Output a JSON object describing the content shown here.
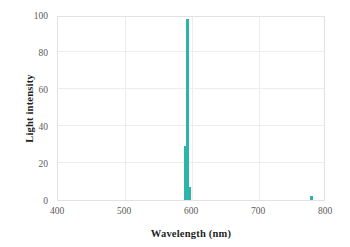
{
  "chart_data": {
    "type": "bar",
    "title": "",
    "subtitle": "",
    "xlabel": "Wavelength (nm)",
    "ylabel": "Light intensity",
    "xlim": [
      400,
      800
    ],
    "ylim": [
      0,
      100
    ],
    "xticks": [
      400,
      500,
      600,
      700,
      800
    ],
    "yticks": [
      0,
      20,
      40,
      60,
      80,
      100
    ],
    "xtick_labels": [
      "400",
      "500",
      "600",
      "700",
      "800"
    ],
    "ytick_labels": [
      "0",
      "20",
      "40",
      "60",
      "80",
      "100"
    ],
    "grid": true,
    "legend": false,
    "legend_position": "none",
    "bar_color": "#2eb5ab",
    "bar_width_nm": 3,
    "series": [
      {
        "name": "Light intensity",
        "color": "#2eb5ab",
        "x": [
          589,
          592,
          596,
          777
        ],
        "values": [
          29,
          98,
          7,
          2
        ]
      }
    ],
    "annotations": []
  },
  "axes": {
    "x": {
      "label": "Wavelength (nm)",
      "ticks": [
        "400",
        "500",
        "600",
        "700",
        "800"
      ]
    },
    "y": {
      "label": "Light intensity",
      "ticks": [
        "0",
        "20",
        "40",
        "60",
        "80",
        "100"
      ]
    }
  }
}
